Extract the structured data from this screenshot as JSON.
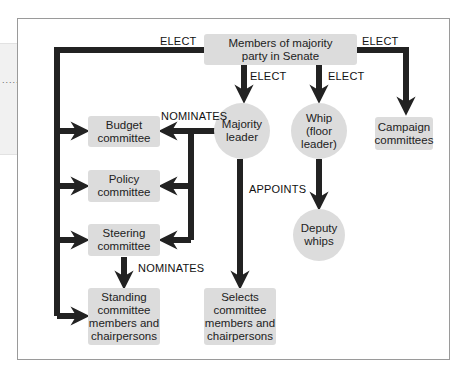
{
  "side_panel": {
    "dots": "......"
  },
  "nodes": {
    "members": "Members of majority\nparty in Senate",
    "budget": "Budget\ncommittee",
    "policy": "Policy\ncommittee",
    "steering": "Steering\ncommittee",
    "standing": "Standing\ncommittee\nmembers and\nchairpersons",
    "majority_leader": "Majority\nleader",
    "whip": "Whip\n(floor\nleader)",
    "deputy_whips": "Deputy\nwhips",
    "selects": "Selects\ncommittee\nmembers and\nchairpersons",
    "campaign": "Campaign\ncommittees"
  },
  "labels": {
    "elect_left": "ELECT",
    "elect_right": "ELECT",
    "elect_leader": "ELECT",
    "elect_whip": "ELECT",
    "nominates_leader": "NOMINATES",
    "nominates_steering": "NOMINATES",
    "appoints": "APPOINTS"
  },
  "colors": {
    "node_fill": "#dcdcdc",
    "arrow": "#222222",
    "frame": "#9a9a9a"
  }
}
